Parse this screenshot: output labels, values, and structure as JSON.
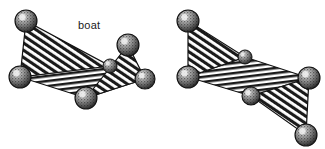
{
  "figure": {
    "name": "cyclohexane-conformations",
    "background_color": "#ffffff",
    "width": 325,
    "height": 149,
    "style": "line-art stippled ball-and-stick with hatched faces"
  },
  "colors": {
    "ink": "#111111",
    "hatch": "#1a1a1a",
    "sphere_fill": "#8a8a8a",
    "sphere_stipple": "#111111",
    "sphere_highlight": "#e8e8e8",
    "background": "#ffffff"
  },
  "panels": [
    {
      "id": "boat",
      "label": "boat",
      "vertex_count": 6,
      "vertices": [
        {
          "name": "v1",
          "x": 26,
          "y": 21,
          "r": 11,
          "role": "raised-left-prow"
        },
        {
          "name": "v2",
          "x": 20,
          "y": 77,
          "r": 11,
          "role": "lower-left"
        },
        {
          "name": "v3",
          "x": 86,
          "y": 98,
          "r": 11,
          "role": "lower-front"
        },
        {
          "name": "v4",
          "x": 145,
          "y": 79,
          "r": 10,
          "role": "lower-right"
        },
        {
          "name": "v5",
          "x": 128,
          "y": 45,
          "r": 11,
          "role": "raised-right-prow"
        },
        {
          "name": "v6",
          "x": 110,
          "y": 66,
          "r": 7,
          "role": "rear-middle"
        }
      ],
      "faces": [
        {
          "name": "left-prow-face",
          "hatch": "diagonal",
          "vertices": [
            "v1",
            "v2",
            "v6"
          ]
        },
        {
          "name": "right-prow-face",
          "hatch": "diagonal",
          "vertices": [
            "v5",
            "v3",
            "v4"
          ]
        },
        {
          "name": "central-deck",
          "hatch": "horizontal",
          "vertices": [
            "v2",
            "v6",
            "v4",
            "v3"
          ]
        }
      ]
    },
    {
      "id": "chair",
      "label": "chair",
      "vertex_count": 6,
      "vertices": [
        {
          "name": "v1",
          "x": 25,
          "y": 21,
          "r": 11,
          "role": "raised-upper-left"
        },
        {
          "name": "v2",
          "x": 25,
          "y": 77,
          "r": 11,
          "role": "lower-left"
        },
        {
          "name": "v3",
          "x": 88,
          "y": 96,
          "r": 9,
          "role": "front-middle"
        },
        {
          "name": "v4",
          "x": 143,
          "y": 135,
          "r": 11,
          "role": "lowered-lower-right"
        },
        {
          "name": "v5",
          "x": 146,
          "y": 78,
          "r": 11,
          "role": "right"
        },
        {
          "name": "v6",
          "x": 82,
          "y": 57,
          "r": 7,
          "role": "rear-middle"
        }
      ],
      "faces": [
        {
          "name": "upper-left-face",
          "hatch": "diagonal",
          "vertices": [
            "v1",
            "v2",
            "v6"
          ]
        },
        {
          "name": "lower-right-face",
          "hatch": "diagonal",
          "vertices": [
            "v5",
            "v3",
            "v4"
          ]
        },
        {
          "name": "central-deck",
          "hatch": "horizontal",
          "vertices": [
            "v2",
            "v6",
            "v5",
            "v3"
          ]
        }
      ]
    }
  ]
}
